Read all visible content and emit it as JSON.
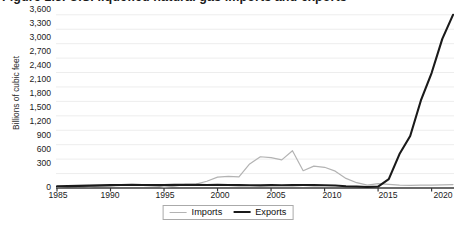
{
  "title": "Figure 1.3. U.S. liquefied natural gas imports and exports",
  "axis": {
    "y_title": "Billions of cubic feet",
    "y_ticks": [
      "3,600",
      "3,300",
      "3,000",
      "2,700",
      "2,400",
      "2,100",
      "1,800",
      "1,500",
      "1,200",
      "900",
      "600",
      "300",
      "0"
    ],
    "x_ticks": [
      "1985",
      "1990",
      "1995",
      "2000",
      "2005",
      "2010",
      "2015",
      "2020"
    ]
  },
  "legend": {
    "position": "bottom-center",
    "items": [
      {
        "label": "Imports",
        "color": "#b3b3b3",
        "width": 1.1
      },
      {
        "label": "Exports",
        "color": "#1a1a1a",
        "width": 2.1
      }
    ]
  },
  "colors": {
    "imports": "#b3b3b3",
    "exports": "#1a1a1a",
    "axis": "#3a3a3a",
    "grid": "#ededed",
    "text": "#1b1b1b",
    "background": "#ffffff"
  },
  "chart_data": {
    "type": "line",
    "title": "Figure 1.3. U.S. liquefied natural gas imports and exports",
    "xlabel": "",
    "ylabel": "Billions of cubic feet",
    "xlim": [
      1985,
      2022
    ],
    "ylim": [
      0,
      3700
    ],
    "grid": true,
    "legend": "bottom-center",
    "x": [
      1985,
      1986,
      1987,
      1988,
      1989,
      1990,
      1991,
      1992,
      1993,
      1994,
      1995,
      1996,
      1997,
      1998,
      1999,
      2000,
      2001,
      2002,
      2003,
      2004,
      2005,
      2006,
      2007,
      2008,
      2009,
      2010,
      2011,
      2012,
      2013,
      2014,
      2015,
      2016,
      2017,
      2018,
      2019,
      2020,
      2021,
      2022
    ],
    "series": [
      {
        "name": "Imports",
        "color": "#b3b3b3",
        "values": [
          24,
          33,
          40,
          30,
          39,
          42,
          62,
          62,
          72,
          52,
          18,
          38,
          75,
          80,
          140,
          225,
          240,
          230,
          500,
          650,
          630,
          585,
          775,
          360,
          455,
          430,
          350,
          200,
          110,
          60,
          90,
          75,
          60,
          55,
          60,
          60,
          65,
          70
        ]
      },
      {
        "name": "Exports",
        "color": "#1a1a1a",
        "values": [
          35,
          40,
          45,
          50,
          55,
          60,
          62,
          65,
          62,
          60,
          62,
          65,
          68,
          65,
          62,
          65,
          62,
          60,
          58,
          55,
          60,
          58,
          60,
          62,
          60,
          58,
          52,
          35,
          30,
          20,
          30,
          185,
          705,
          1080,
          1820,
          2390,
          3100,
          3600
        ]
      }
    ],
    "notes": [
      "Imports peak near 775 in 2007 then decline sharply after 2010.",
      "Exports remain near zero until 2016, then rise steeply to about 3,600 by 2022.",
      "The two series cross around 2016-2017."
    ]
  }
}
